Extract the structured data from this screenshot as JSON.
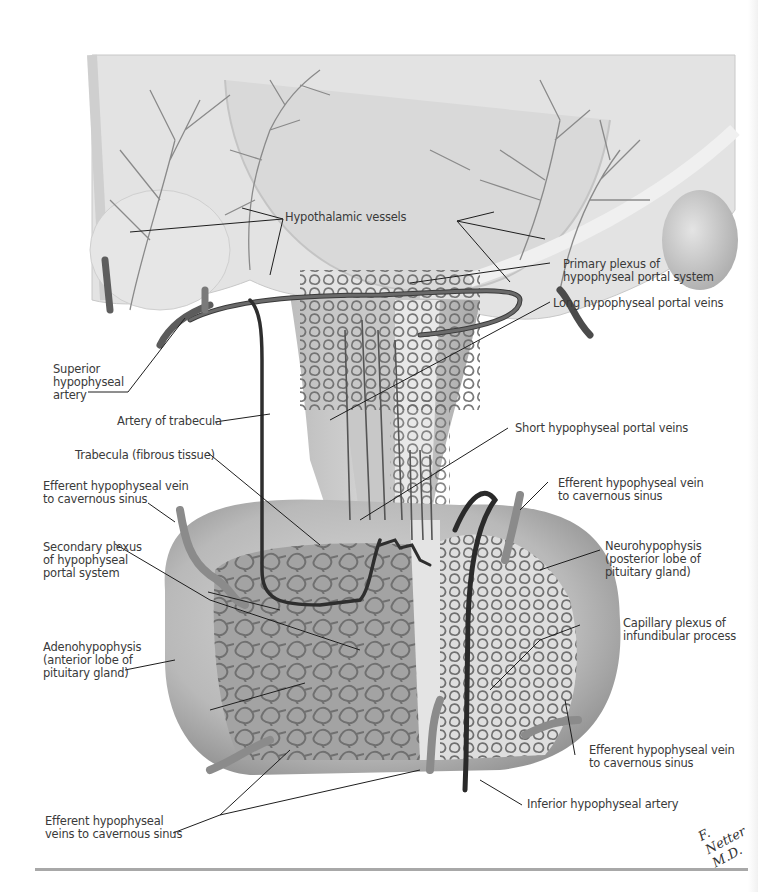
{
  "figure": {
    "signature": "F. Netter M.D.",
    "colors": {
      "background": "#ffffff",
      "tissue_light": "#e6e6e6",
      "tissue_mid": "#cfcfcf",
      "tissue_dark": "#9a9a9a",
      "vessel": "#6f6f6f",
      "vessel_dark": "#2c2c2c",
      "leader_line": "#1e1e1e",
      "label_text": "#3a3a3a",
      "rule": "#a8a8a8"
    }
  },
  "labels": {
    "hypothalamic_vessels": "Hypothalamic vessels",
    "primary_plexus": "Primary plexus of\nhypophyseal portal system",
    "superior_hypophyseal_artery": "Superior\nhypophyseal\nartery",
    "long_portal_veins": "Long hypophyseal portal veins",
    "artery_of_trabecula": "Artery of trabecula",
    "short_portal_veins": "Short hypophyseal portal veins",
    "trabecula": "Trabecula (fibrous tissue)",
    "efferent_vein_upper_left": "Efferent hypophyseal vein\nto cavernous sinus",
    "efferent_vein_upper_right": "Efferent hypophyseal vein\nto cavernous sinus",
    "secondary_plexus": "Secondary plexus\nof hypophyseal\nportal system",
    "neurohypophysis": "Neurohypophysis\n(posterior lobe of\npituitary gland)",
    "adenohypophysis": "Adenohypophysis\n(anterior lobe of\npituitary gland)",
    "capillary_plexus": "Capillary plexus of\ninfundibular process",
    "efferent_vein_lower_right": "Efferent hypophyseal vein\nto cavernous sinus",
    "inferior_hypophyseal_artery": "Inferior hypophyseal artery",
    "efferent_veins_bottom_left": "Efferent hypophyseal\nveins to cavernous sinus"
  }
}
